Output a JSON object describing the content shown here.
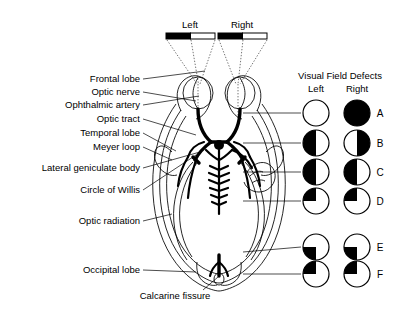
{
  "figure": {
    "stimulus": {
      "left_label": "Left",
      "right_label": "Right"
    }
  },
  "anatomy_labels": [
    {
      "id": "frontal-lobe",
      "text": "Frontal lobe",
      "x": 140,
      "y": 79,
      "tx": 205,
      "ty": 71
    },
    {
      "id": "optic-nerve",
      "text": "Optic nerve",
      "x": 140,
      "y": 92,
      "tx": 196,
      "ty": 101
    },
    {
      "id": "ophthalmic-artery",
      "text": "Ophthalmic artery",
      "x": 140,
      "y": 105,
      "tx": 199,
      "ty": 96
    },
    {
      "id": "optic-tract",
      "text": "Optic tract",
      "x": 140,
      "y": 119,
      "tx": 196,
      "ty": 135
    },
    {
      "id": "temporal-lobe",
      "text": "Temporal lobe",
      "x": 140,
      "y": 133,
      "tx": 176,
      "ty": 151
    },
    {
      "id": "meyer-loop",
      "text": "Meyer loop",
      "x": 140,
      "y": 147,
      "tx": 172,
      "ty": 160
    },
    {
      "id": "lateral-geniculate-body",
      "text": "Lateral geniculate body",
      "x": 140,
      "y": 168,
      "tx": 200,
      "ty": 152
    },
    {
      "id": "circle-of-willis",
      "text": "Circle of Willis",
      "x": 140,
      "y": 190,
      "tx": 196,
      "ty": 155
    },
    {
      "id": "optic-radiation",
      "text": "Optic radiation",
      "x": 140,
      "y": 221,
      "tx": 172,
      "ty": 214
    },
    {
      "id": "occipital-lobe",
      "text": "Occipital lobe",
      "x": 140,
      "y": 270,
      "tx": 196,
      "ty": 272
    },
    {
      "id": "calcarine-fissure",
      "text": "Calcarine fissure",
      "x": 175,
      "y": 296,
      "tx": 218,
      "ty": 277
    }
  ],
  "defect_panel": {
    "title": "Visual Field Defects",
    "col_left": "Left",
    "col_right": "Right",
    "title_x": 340,
    "title_y": 75,
    "col_left_x": 316,
    "col_right_x": 357,
    "col_y": 88,
    "rows": [
      {
        "letter": "A",
        "y": 113,
        "left": "none",
        "right": "full",
        "leader_to_x": 243,
        "leader_y": 113,
        "gap": true
      },
      {
        "letter": "B",
        "y": 143,
        "left": "left-half",
        "right": "right-half",
        "leader_to_x": 243,
        "leader_y": 143,
        "gap": true
      },
      {
        "letter": "C",
        "y": 172,
        "left": "left-half",
        "right": "left-half",
        "leader_to_x": 243,
        "leader_y": 172,
        "gap": true
      },
      {
        "letter": "D",
        "y": 201,
        "left": "upper-left-q",
        "right": "upper-left-q",
        "leader_to_x": 243,
        "leader_y": 201,
        "gap": true
      },
      {
        "letter": "E",
        "y": 247,
        "left": "lower-left-q",
        "right": "lower-left-q",
        "leader_to_x": 243,
        "leader_y": 252,
        "gap": false
      },
      {
        "letter": "F",
        "y": 274,
        "left": "upper-left-q",
        "right": "upper-left-q",
        "leader_to_x": 243,
        "leader_y": 274,
        "gap": false
      }
    ],
    "circle_radius": 13,
    "left_cx": 316,
    "right_cx": 357,
    "letter_x": 380
  },
  "colors": {
    "ink": "#000000",
    "paper": "#ffffff"
  }
}
